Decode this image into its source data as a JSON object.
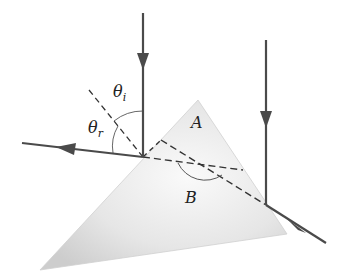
{
  "diagram": {
    "type": "optics-prism-reflection",
    "labels": {
      "theta_i": "θ",
      "theta_i_sub": "i",
      "theta_r": "θ",
      "theta_r_sub": "r",
      "angle_a": "A",
      "angle_b": "B"
    },
    "colors": {
      "ray": "#4a4a4a",
      "prism_light": "#f4f4f4",
      "prism_dark": "#cfcfcf",
      "dashed": "#333333"
    },
    "prism": {
      "top": [
        198,
        100
      ],
      "right": [
        287,
        234
      ],
      "bottom_left": [
        40,
        270
      ]
    },
    "rays": [
      {
        "name": "left-incident",
        "from": [
          143,
          13
        ],
        "to": [
          143,
          157
        ]
      },
      {
        "name": "left-reflected",
        "from": [
          143,
          157
        ],
        "to": [
          22,
          143
        ]
      },
      {
        "name": "right-incident",
        "from": [
          266,
          40
        ],
        "to": [
          266,
          205
        ]
      },
      {
        "name": "right-exit",
        "from": [
          266,
          205
        ],
        "to": [
          326,
          243
        ]
      }
    ]
  }
}
